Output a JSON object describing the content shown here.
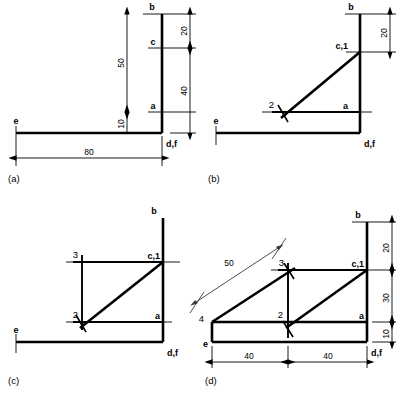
{
  "figure": {
    "background_color": "#ffffff",
    "line_color": "#000000",
    "panels": [
      {
        "caption": "(a)",
        "point_labels": [
          "b",
          "c",
          "a",
          "e",
          "d,f"
        ],
        "dimensions": [
          "50",
          "10",
          "20",
          "40",
          "80"
        ],
        "construction_marks": []
      },
      {
        "caption": "(b)",
        "point_labels": [
          "b",
          "c,1",
          "a",
          "e",
          "d,f"
        ],
        "dimensions": [
          "20"
        ],
        "construction_marks": [
          "2"
        ]
      },
      {
        "caption": "(c)",
        "point_labels": [
          "b",
          "c,1",
          "a",
          "e",
          "d,f"
        ],
        "dimensions": [],
        "construction_marks": [
          "3",
          "2"
        ]
      },
      {
        "caption": "(d)",
        "point_labels": [
          "b",
          "c,1",
          "a",
          "e",
          "d,f"
        ],
        "dimensions": [
          "50",
          "20",
          "30",
          "10",
          "40",
          "40"
        ],
        "construction_marks": [
          "3",
          "2",
          "4"
        ]
      }
    ]
  },
  "panel_a": {
    "caption": "(a)",
    "label_b": "b",
    "label_c": "c",
    "label_a": "a",
    "label_e": "e",
    "label_df": "d,f",
    "dim_50": "50",
    "dim_10": "10",
    "dim_20": "20",
    "dim_40": "40",
    "dim_80": "80"
  },
  "panel_b": {
    "caption": "(b)",
    "label_b": "b",
    "label_c1": "c,1",
    "label_a": "a",
    "label_e": "e",
    "label_df": "d,f",
    "mark_2": "2",
    "dim_20": "20"
  },
  "panel_c": {
    "caption": "(c)",
    "label_b": "b",
    "label_c1": "c,1",
    "label_a": "a",
    "label_e": "e",
    "label_df": "d,f",
    "mark_3": "3",
    "mark_2": "2"
  },
  "panel_d": {
    "caption": "(d)",
    "label_b": "b",
    "label_c1": "c,1",
    "label_a": "a",
    "label_e": "e",
    "label_df": "d,f",
    "mark_3": "3",
    "mark_2": "2",
    "mark_4": "4",
    "dim_50": "50",
    "dim_20": "20",
    "dim_30": "30",
    "dim_10": "10",
    "dim_40_left": "40",
    "dim_40_right": "40"
  }
}
